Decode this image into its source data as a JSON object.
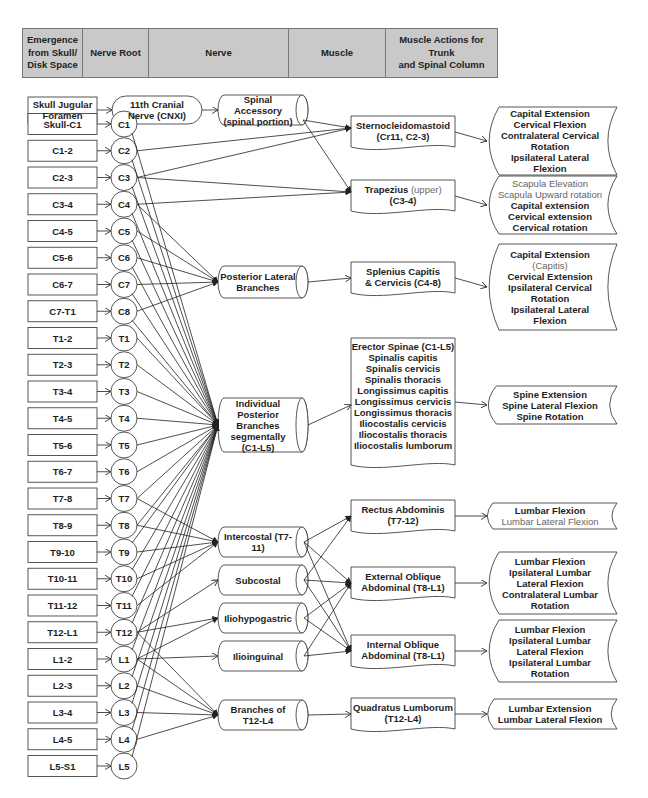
{
  "header": {
    "columns": [
      "Emergence\nfrom Skull/\nDisk Space",
      "Nerve Root",
      "Nerve",
      "Muscle",
      "Muscle Actions for Trunk\nand Spinal Column"
    ],
    "fill": "#c9c9c9"
  },
  "emergence": [
    "Skull Jugular\nForamen",
    "Skull-C1",
    "C1-2",
    "C2-3",
    "C3-4",
    "C4-5",
    "C5-6",
    "C6-7",
    "C7-T1",
    "T1-2",
    "T2-3",
    "T3-4",
    "T4-5",
    "T5-6",
    "T6-7",
    "T7-8",
    "T8-9",
    "T9-10",
    "T10-11",
    "T11-12",
    "T12-L1",
    "L1-2",
    "L2-3",
    "L3-4",
    "L4-5",
    "L5-S1"
  ],
  "roots": [
    "11th Cranial\nNerve (CNXI)",
    "C1",
    "C2",
    "C3",
    "C4",
    "C5",
    "C6",
    "C7",
    "C8",
    "T1",
    "T2",
    "T3",
    "T4",
    "T5",
    "T6",
    "T7",
    "T8",
    "T9",
    "T10",
    "T11",
    "T12",
    "L1",
    "L2",
    "L3",
    "L4",
    "L5"
  ],
  "nerves": [
    "Spinal Accessory\n(spinal portion)",
    "Posterior Lateral\nBranches",
    "Individual\nPosterior Branches\nsegmentally\n(C1-L5)",
    "Intercostal (T7-11)",
    "Subcostal",
    "Iliohypogastric",
    "Ilioinguinal",
    "Branches of\nT12-L4"
  ],
  "muscles": [
    {
      "bold": "Sternocleidomastoid\n(Cr11, C2-3)",
      "light": ""
    },
    {
      "bold": "Trapezius",
      "light": " (upper)",
      "bold2": "\n(C3-4)"
    },
    {
      "bold": "Splenius Capitis\n& Cervicis (C4-8)",
      "light": ""
    },
    {
      "bold": "Erector Spinae (C1-L5)\nSpinalis capitis\nSpinalis cervicis\nSpinalis thoracis\nLongissimus capitis\nLongissimus cervicis\nLongissimus thoracis\nIliocostalis cervicis\nIliocostalis thoracis\nIliocostalis lumborum",
      "light": ""
    },
    {
      "bold": "Rectus Abdominis\n(T7-12)",
      "light": ""
    },
    {
      "bold": "External Oblique\nAbdominal (T8-L1)",
      "light": ""
    },
    {
      "bold": "Internal Oblique\nAbdominal (T8-L1)",
      "light": ""
    },
    {
      "bold": "Quadratus Lumborum\n(T12-L4)",
      "light": ""
    }
  ],
  "actions": [
    {
      "light_top": "",
      "bold": "Capital Extension\nCervical Flexion\nContralateral Cervical\nRotation\nIpsilateral Lateral\nFlexion"
    },
    {
      "light_top": "Scapula Elevation\nScapula Upward rotation",
      "bold": "Capital extension\nCervical extension\nCervical rotation"
    },
    {
      "bold_top": "Capital Extension",
      "light_mid": "(Capitis)",
      "bold": "Cervical Extension\nIpsilateral Cervical\nRotation\nIpsilateral Lateral\nFlexion"
    },
    {
      "light_top": "",
      "bold": "Spine Extension\nSpine Lateral Flexion\nSpine Rotation"
    },
    {
      "bold_top": "Lumbar Flexion",
      "light_mid": "Lumbar Lateral Flexion",
      "bold": ""
    },
    {
      "light_top": "",
      "bold": "Lumbar Flexion\nIpsilateral Lumbar\nLateral Flexion\nContralateral Lumbar\nRotation"
    },
    {
      "light_top": "",
      "bold": "Lumbar Flexion\nIpsilateral Lumbar\nLateral Flexion\nIpsilateral Lumbar\nRotation"
    },
    {
      "light_top": "",
      "bold": "Lumbar Extension\nLumbar Lateral Flexion"
    }
  ],
  "colors": {
    "stroke": "#333333",
    "text": "#1e1e1e",
    "light_text": "#666666"
  }
}
